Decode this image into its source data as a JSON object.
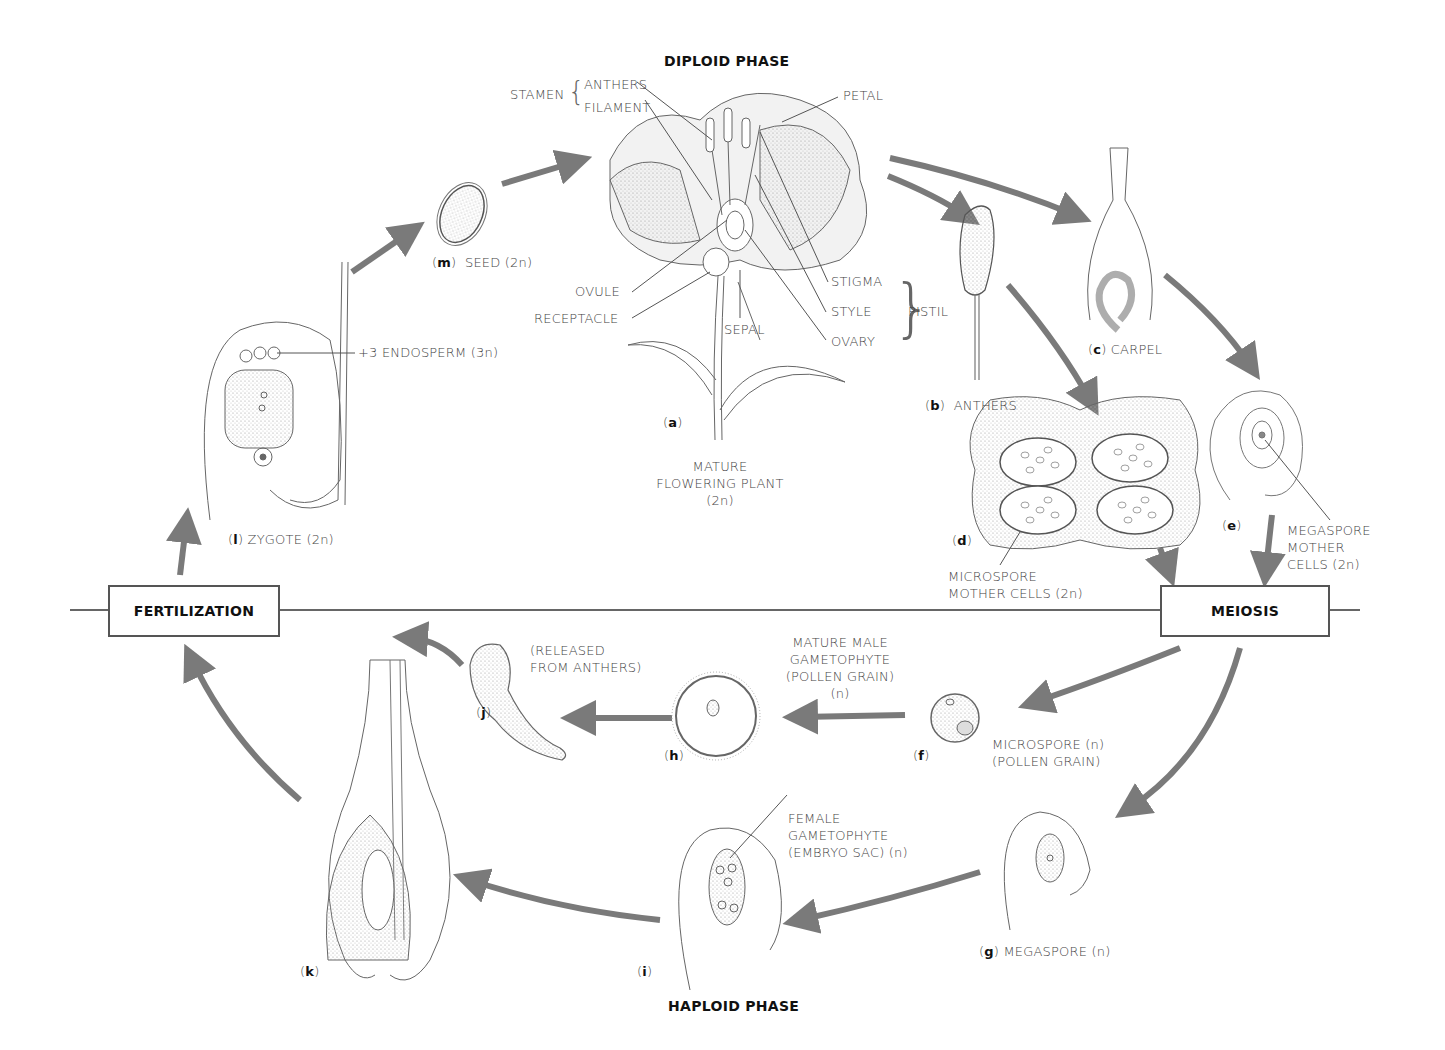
{
  "title_top": "DIPLOID PHASE",
  "title_bottom": "HAPLOID PHASE",
  "boxes": {
    "fertilization": "FERTILIZATION",
    "meiosis": "MEIOSIS"
  },
  "flower_labels": {
    "stamen": "STAMEN",
    "anthers": "ANTHERS",
    "filament": "FILAMENT",
    "petal": "PETAL",
    "ovule": "OVULE",
    "receptacle": "RECEPTACLE",
    "sepal": "SEPAL",
    "stigma": "STIGMA",
    "style": "STYLE",
    "ovary": "OVARY",
    "pistil": "PISTIL"
  },
  "stages": {
    "a": {
      "letter": "a",
      "caption_lines": [
        "MATURE",
        "FLOWERING PLANT",
        "(2n)"
      ]
    },
    "b": {
      "letter": "b",
      "caption": "ANTHERS"
    },
    "c": {
      "letter": "c",
      "caption": "CARPEL"
    },
    "d": {
      "letter": "d",
      "caption_lines": [
        "MICROSPORE",
        "MOTHER CELLS (2n)"
      ]
    },
    "e": {
      "letter": "e",
      "caption_lines": [
        "MEGASPORE",
        "MOTHER",
        "CELLS (2n)"
      ]
    },
    "f": {
      "letter": "f",
      "caption_lines": [
        "MICROSPORE (n)",
        "(POLLEN GRAIN)"
      ]
    },
    "g": {
      "letter": "g",
      "caption": "MEGASPORE (n)"
    },
    "h": {
      "letter": "h",
      "caption_lines": [
        "MATURE MALE",
        "GAMETOPHYTE",
        "(POLLEN GRAIN)",
        "(n)"
      ]
    },
    "i": {
      "letter": "i",
      "caption_lines": [
        "FEMALE",
        "GAMETOPHYTE",
        "(EMBRYO SAC) (n)"
      ]
    },
    "j": {
      "letter": "j",
      "caption_lines": [
        "(RELEASED",
        "FROM ANTHERS)"
      ]
    },
    "k": {
      "letter": "k"
    },
    "l": {
      "letter": "l",
      "caption": "ZYGOTE (2n)",
      "endosperm": "+3 ENDOSPERM (3n)"
    },
    "m": {
      "letter": "m",
      "caption": "SEED (2n)"
    }
  },
  "colors": {
    "arrow": "#7a7a7a",
    "line": "#555555",
    "stipple": "#d9d9d9"
  }
}
